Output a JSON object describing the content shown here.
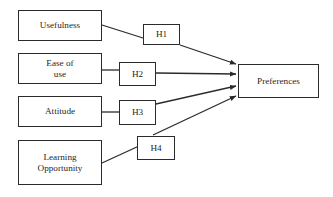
{
  "diagram": {
    "type": "research-model-path-diagram",
    "background_color": "#ffffff",
    "line_color": "#2b2b2b",
    "text_color": "#1f1f1f",
    "constructs": [
      {
        "id": "usefulness",
        "label": "Usefulness",
        "x": 18,
        "y": 10,
        "w": 84,
        "h": 31
      },
      {
        "id": "ease-of-use",
        "label": "Ease of\nuse",
        "x": 18,
        "y": 53,
        "w": 84,
        "h": 31
      },
      {
        "id": "attitude",
        "label": "Attitude",
        "x": 18,
        "y": 96,
        "w": 84,
        "h": 31
      },
      {
        "id": "learning-opportunity",
        "label": "Learning\nOpportunity",
        "x": 18,
        "y": 140,
        "w": 84,
        "h": 45
      }
    ],
    "hypotheses": [
      {
        "id": "h1",
        "label": "H1",
        "x": 143,
        "y": 24,
        "w": 37,
        "h": 21
      },
      {
        "id": "h2",
        "label": "H2",
        "x": 119,
        "y": 62,
        "w": 37,
        "h": 24
      },
      {
        "id": "h3",
        "label": "H3",
        "x": 119,
        "y": 100,
        "w": 37,
        "h": 25
      },
      {
        "id": "h4",
        "label": "H4",
        "x": 137,
        "y": 136,
        "w": 38,
        "h": 24
      }
    ],
    "outcome": {
      "id": "preferences",
      "label": "Preferences",
      "x": 238,
      "y": 64,
      "w": 81,
      "h": 34
    },
    "connectors": [
      {
        "id": "usefulness-to-h1",
        "from": "usefulness",
        "to": "h1",
        "arrow": false,
        "points": "102,25 143,38"
      },
      {
        "id": "h1-to-preferences",
        "from": "h1",
        "to": "preferences",
        "arrow": true,
        "points": "180,45 236,64"
      },
      {
        "id": "ease-of-use-to-h2",
        "from": "ease-of-use",
        "to": "h2",
        "arrow": false,
        "points": "102,70 119,70"
      },
      {
        "id": "h2-to-preferences",
        "from": "h2",
        "to": "preferences",
        "arrow": true,
        "points": "156,73 236,74"
      },
      {
        "id": "attitude-to-h3",
        "from": "attitude",
        "to": "h3",
        "arrow": false,
        "points": "102,112 119,112"
      },
      {
        "id": "h3-to-preferences",
        "from": "h3",
        "to": "preferences",
        "arrow": true,
        "points": "156,104 236,86"
      },
      {
        "id": "learning-opportunity-to-h4",
        "from": "learning-opportunity",
        "to": "h4",
        "arrow": false,
        "points": "102,163 139,146"
      },
      {
        "id": "h4-to-preferences",
        "from": "h4",
        "to": "preferences",
        "arrow": true,
        "points": "153,135 236,96"
      }
    ]
  }
}
